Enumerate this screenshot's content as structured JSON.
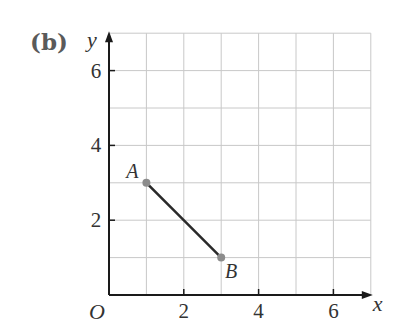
{
  "part_label": "(b)",
  "chart_data": {
    "type": "line",
    "title": "",
    "xlabel": "x",
    "ylabel": "y",
    "origin_label": "O",
    "xlim": [
      0,
      7
    ],
    "ylim": [
      0,
      7
    ],
    "grid": true,
    "grid_step": 1,
    "x_ticks": [
      2,
      4,
      6
    ],
    "y_ticks": [
      2,
      4,
      6
    ],
    "x_tick_labels": [
      "2",
      "4",
      "6"
    ],
    "y_tick_labels": [
      "2",
      "4",
      "6"
    ],
    "points": [
      {
        "label": "A",
        "x": 1,
        "y": 3
      },
      {
        "label": "B",
        "x": 3,
        "y": 1
      }
    ],
    "segments": [
      {
        "from": "A",
        "to": "B"
      }
    ]
  },
  "colors": {
    "grid": "#c8c8c8",
    "axis": "#1a1a1a",
    "segment": "#2a2a2a",
    "point": "#8c8c8c",
    "text": "#333333"
  }
}
